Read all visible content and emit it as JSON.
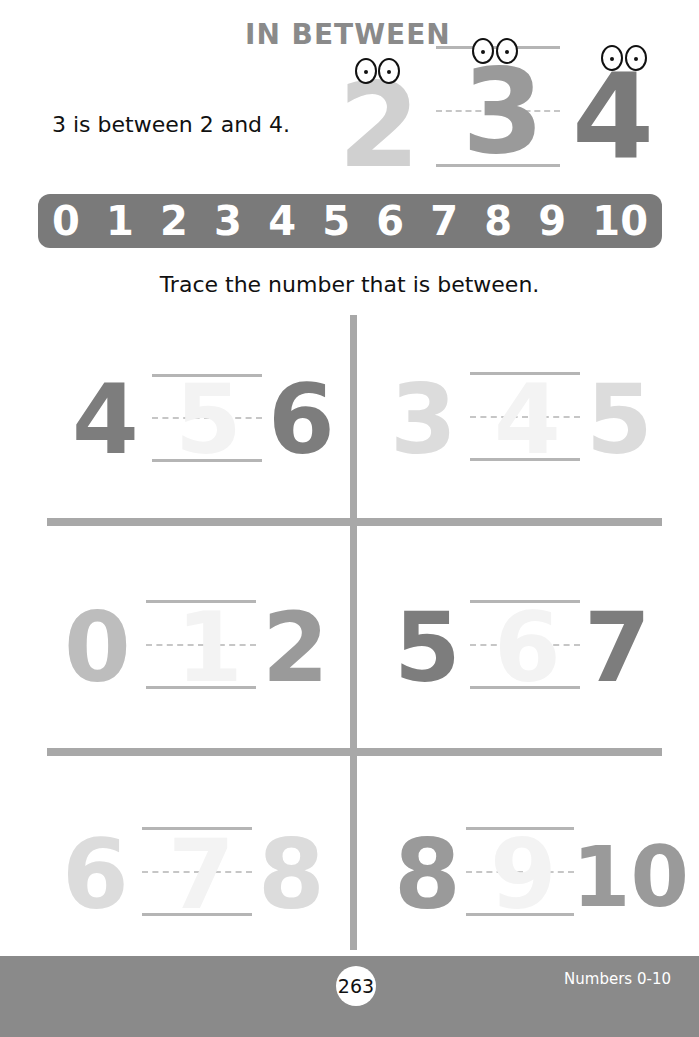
{
  "header": {
    "title": "IN BETWEEN",
    "example_sentence": "3 is between 2 and 4.",
    "example_numbers": [
      {
        "value": "2",
        "color": "#d0d0d0"
      },
      {
        "value": "3",
        "color": "#9a9a9a"
      },
      {
        "value": "4",
        "color": "#7a7a7a"
      }
    ]
  },
  "number_line": {
    "numbers": [
      "0",
      "1",
      "2",
      "3",
      "4",
      "5",
      "6",
      "7",
      "8",
      "9",
      "10"
    ],
    "background": "#7a7a7a"
  },
  "instruction": "Trace the number that is between.",
  "exercises": [
    {
      "left": "4",
      "middle": "5",
      "right": "6",
      "left_color": "#7d7d7d",
      "right_color": "#7d7d7d"
    },
    {
      "left": "3",
      "middle": "4",
      "right": "5",
      "left_color": "#dcdcdc",
      "right_color": "#dcdcdc"
    },
    {
      "left": "0",
      "middle": "1",
      "right": "2",
      "left_color": "#bdbdbd",
      "right_color": "#9a9a9a"
    },
    {
      "left": "5",
      "middle": "6",
      "right": "7",
      "left_color": "#7d7d7d",
      "right_color": "#7d7d7d"
    },
    {
      "left": "6",
      "middle": "7",
      "right": "8",
      "left_color": "#dcdcdc",
      "right_color": "#dcdcdc"
    },
    {
      "left": "8",
      "middle": "9",
      "right": "10",
      "left_color": "#9a9a9a",
      "right_color": "#9a9a9a"
    }
  ],
  "footer": {
    "page_number": "263",
    "section": "Numbers 0-10"
  }
}
